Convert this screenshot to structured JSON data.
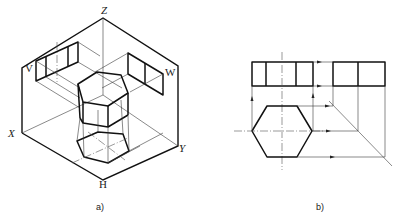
{
  "figure_a": {
    "caption": "a)",
    "axis_labels": {
      "z": "Z",
      "x": "X",
      "y": "Y"
    },
    "plane_labels": {
      "v": "V",
      "w": "W",
      "h": "H"
    }
  },
  "figure_b": {
    "caption": "b)"
  }
}
